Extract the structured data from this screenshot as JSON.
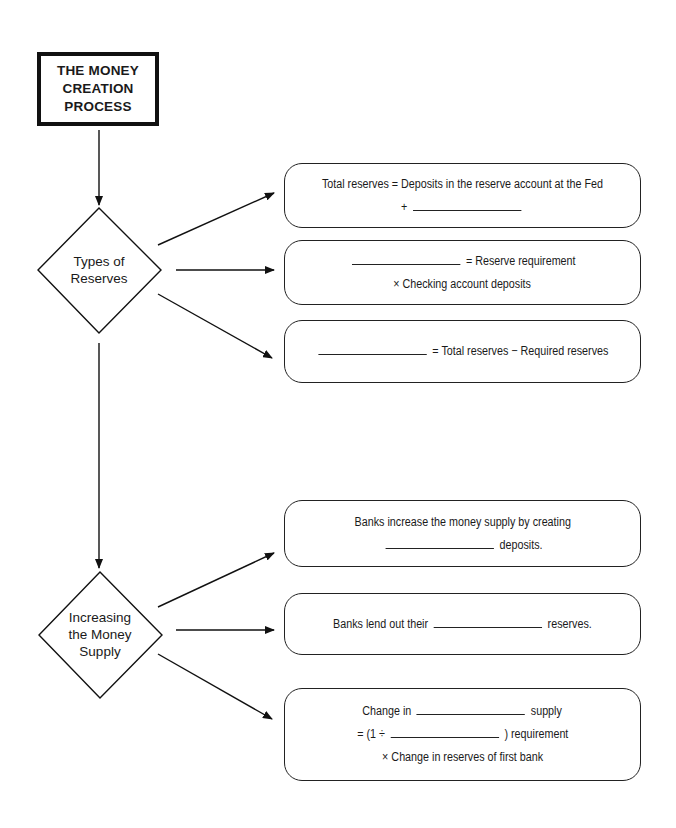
{
  "title": {
    "lines": [
      "THE MONEY",
      "CREATION",
      "PROCESS"
    ]
  },
  "nodes": [
    {
      "label_lines": [
        "Types of",
        "Reserves"
      ],
      "branches": [
        {
          "lines": [
            {
              "before": "Total reserves = Deposits in the reserve account at the Fed",
              "blank": false,
              "after": ""
            },
            {
              "before": "+",
              "blank": true,
              "after": ""
            }
          ]
        },
        {
          "lines": [
            {
              "before": "",
              "blank": true,
              "after": "= Reserve requirement"
            },
            {
              "before": "× Checking account deposits",
              "blank": false,
              "after": ""
            }
          ]
        },
        {
          "lines": [
            {
              "before": "",
              "blank": true,
              "after": "= Total reserves − Required reserves"
            }
          ]
        }
      ]
    },
    {
      "label_lines": [
        "Increasing",
        "the Money",
        "Supply"
      ],
      "branches": [
        {
          "lines": [
            {
              "before": "Banks increase the money supply by creating",
              "blank": false,
              "after": ""
            },
            {
              "before": "",
              "blank": true,
              "after": "deposits."
            }
          ]
        },
        {
          "lines": [
            {
              "before": "Banks lend out their",
              "blank": true,
              "after": "reserves."
            }
          ]
        },
        {
          "lines": [
            {
              "before": "Change in",
              "blank": true,
              "after": "supply"
            },
            {
              "before": "= (1 ÷",
              "blank": true,
              "after": ") requirement"
            },
            {
              "before": "× Change in reserves of first bank",
              "blank": false,
              "after": ""
            }
          ]
        }
      ]
    }
  ],
  "colors": {
    "stroke": "#111111",
    "background": "#ffffff"
  }
}
